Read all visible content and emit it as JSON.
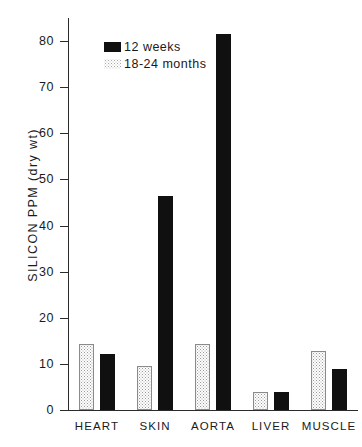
{
  "chart_data": {
    "type": "bar",
    "title": "",
    "xlabel": "",
    "ylabel": "SILICON PPM (dry wt)",
    "ylim": [
      0,
      85
    ],
    "yticks": [
      0,
      10,
      20,
      30,
      40,
      50,
      60,
      70,
      80
    ],
    "ytick_labels": [
      "0",
      "10",
      "20",
      "30",
      "40",
      "50",
      "60",
      "70",
      "80"
    ],
    "grid": false,
    "legend_position": "upper-left-inside",
    "categories": [
      "HEART",
      "SKIN",
      "AORTA",
      "LIVER",
      "MUSCLE"
    ],
    "series": [
      {
        "name": "18-24 months",
        "style": "stippled",
        "color": "#fdfdfd",
        "values": [
          14.3,
          9.6,
          14.3,
          3.9,
          12.9
        ]
      },
      {
        "name": "12 weeks",
        "style": "solid",
        "color": "#101010",
        "values": [
          12.2,
          46.3,
          81.5,
          3.9,
          9.0
        ]
      }
    ]
  },
  "legend": {
    "entries": [
      {
        "label": "12 weeks",
        "swatch": "solid"
      },
      {
        "label": "18-24 months",
        "swatch": "stipple"
      }
    ]
  },
  "colors": {
    "solid_bar": "#101010",
    "stipple_outline": "#8a8a8a",
    "axis": "#2b2b2b",
    "text": "#1a1a1a",
    "background": "#ffffff"
  }
}
